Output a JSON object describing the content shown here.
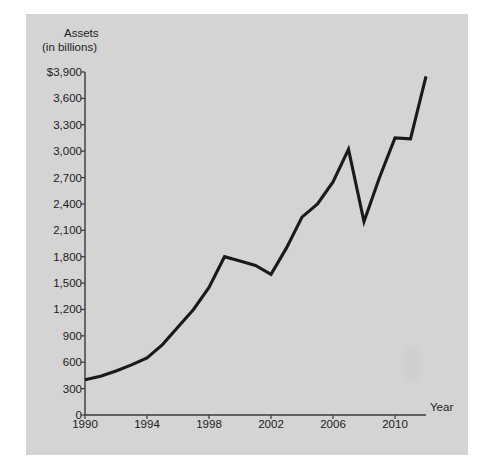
{
  "scan": {
    "top_cut_text": "",
    "bottom_cut_text": ""
  },
  "chart_data": {
    "type": "line",
    "title": "Assets",
    "subtitle": "(in billions)",
    "xlabel": "Year",
    "ylabel": "",
    "grid": false,
    "legend": "none",
    "xlim": [
      1990,
      2012
    ],
    "ylim": [
      0,
      3900
    ],
    "x_ticks": [
      1990,
      1994,
      1998,
      2002,
      2006,
      2010
    ],
    "x_tick_labels": [
      "1990",
      "1994",
      "1998",
      "2002",
      "2006",
      "2010"
    ],
    "y_ticks": [
      0,
      300,
      600,
      900,
      1200,
      1500,
      1800,
      2100,
      2400,
      2700,
      3000,
      3300,
      3600,
      3900
    ],
    "y_tick_labels": [
      "0",
      "300",
      "600",
      "900",
      "1,200",
      "1,500",
      "1,800",
      "2,100",
      "2,400",
      "2,700",
      "3,000",
      "3,300",
      "3,600",
      "$3,900"
    ],
    "line_color": "#1a1a1a",
    "series": [
      {
        "name": "Assets",
        "x": [
          1990,
          1991,
          1992,
          1993,
          1994,
          1995,
          1996,
          1997,
          1998,
          1999,
          2000,
          2001,
          2002,
          2003,
          2004,
          2005,
          2006,
          2007,
          2008,
          2009,
          2010,
          2011,
          2012
        ],
        "values": [
          400,
          440,
          500,
          570,
          650,
          800,
          1000,
          1200,
          1450,
          1800,
          1750,
          1700,
          1600,
          1900,
          2250,
          2400,
          2650,
          3020,
          2200,
          2700,
          3150,
          3140,
          3850
        ]
      }
    ]
  }
}
